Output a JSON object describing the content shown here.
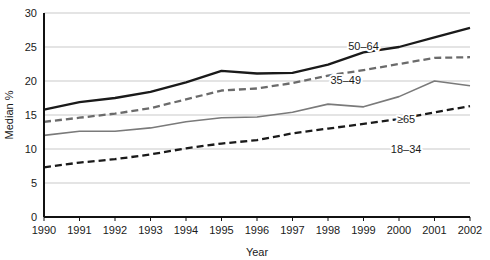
{
  "chart_data": {
    "type": "line",
    "title": "",
    "xlabel": "Year",
    "ylabel": "Median %",
    "x": [
      1990,
      1991,
      1992,
      1993,
      1994,
      1995,
      1996,
      1997,
      1998,
      1999,
      2000,
      2001,
      2002
    ],
    "categories": [
      "1990",
      "1991",
      "1992",
      "1993",
      "1994",
      "1995",
      "1996",
      "1997",
      "1998",
      "1999",
      "2000",
      "2001",
      "2002"
    ],
    "xlim": [
      1990,
      2002
    ],
    "ylim": [
      0,
      30
    ],
    "yticks": [
      0,
      5,
      10,
      15,
      20,
      25,
      30
    ],
    "ytick_labels": [
      "0",
      "5",
      "10",
      "15",
      "20",
      "25",
      "30"
    ],
    "grid": "horizontal",
    "legend": "inline-labels",
    "series": [
      {
        "name": "50-64",
        "label": "50–64",
        "style": "solid",
        "color": "#1a1a1a",
        "width": 2.3,
        "values": [
          15.8,
          16.9,
          17.5,
          18.4,
          19.8,
          21.5,
          21.1,
          21.2,
          22.4,
          24.2,
          25.0,
          26.4,
          27.8
        ]
      },
      {
        "name": "35-49",
        "label": "35–49",
        "style": "dashed",
        "color": "#6b6b6b",
        "width": 2.3,
        "values": [
          14.0,
          14.6,
          15.2,
          16.0,
          17.3,
          18.6,
          18.9,
          19.7,
          20.8,
          21.6,
          22.5,
          23.4,
          23.5
        ]
      },
      {
        "name": ">=65",
        "label": "≥65",
        "style": "solid",
        "color": "#7a7a7a",
        "width": 1.6,
        "values": [
          12.0,
          12.6,
          12.6,
          13.1,
          14.0,
          14.6,
          14.7,
          15.4,
          16.6,
          16.2,
          17.7,
          20.0,
          19.3
        ]
      },
      {
        "name": "18-34",
        "label": "18–34",
        "style": "dashed",
        "color": "#1a1a1a",
        "width": 2.3,
        "values": [
          7.3,
          8.0,
          8.5,
          9.2,
          10.1,
          10.8,
          11.3,
          12.3,
          13.0,
          13.7,
          14.4,
          15.4,
          16.3
        ]
      }
    ],
    "series_label_positions": [
      {
        "label": "50–64",
        "x": 1999.0,
        "y": 24.6
      },
      {
        "label": "35–49",
        "x": 1998.5,
        "y": 19.6
      },
      {
        "label": "≥65",
        "x": 2000.2,
        "y": 13.8
      },
      {
        "label": "18–34",
        "x": 2000.2,
        "y": 9.4
      }
    ],
    "colors": {
      "axis": "#111111",
      "gridline": "#c9c9c9",
      "text": "#1a1a1a",
      "background": "#ffffff"
    }
  }
}
